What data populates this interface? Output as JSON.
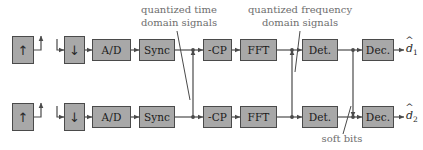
{
  "diagram": {
    "colors": {
      "block_fill": "#a8a8a8",
      "block_border": "#4a4a4a",
      "line": "#4a4a4a",
      "caption_text": "#6e6e6e",
      "background": "#ffffff"
    },
    "antennas": [
      {
        "id": "tx1",
        "symbol": "↑",
        "name": "transmit-antenna-1"
      },
      {
        "id": "rx1",
        "symbol": "↓",
        "name": "receive-antenna-1"
      },
      {
        "id": "tx2",
        "symbol": "↑",
        "name": "transmit-antenna-2"
      },
      {
        "id": "rx2",
        "symbol": "↓",
        "name": "receive-antenna-2"
      }
    ],
    "chains": [
      {
        "id": "chain-1",
        "blocks": [
          {
            "id": "ad-1",
            "label": "A/D"
          },
          {
            "id": "sync-1",
            "label": "Sync"
          },
          {
            "id": "cp-1",
            "label": "-CP"
          },
          {
            "id": "fft-1",
            "label": "FFT"
          },
          {
            "id": "det-1",
            "label": "Det."
          },
          {
            "id": "dec-1",
            "label": "Dec."
          }
        ],
        "output": {
          "base": "d",
          "index": "1"
        }
      },
      {
        "id": "chain-2",
        "blocks": [
          {
            "id": "ad-2",
            "label": "A/D"
          },
          {
            "id": "sync-2",
            "label": "Sync"
          },
          {
            "id": "cp-2",
            "label": "-CP"
          },
          {
            "id": "fft-2",
            "label": "FFT"
          },
          {
            "id": "det-2",
            "label": "Det."
          },
          {
            "id": "dec-2",
            "label": "Dec."
          }
        ],
        "output": {
          "base": "d",
          "index": "2"
        }
      }
    ],
    "captions": {
      "time_domain": {
        "line1": "quantized time",
        "line2": "domain signals"
      },
      "freq_domain": {
        "line1": "quantized frequency",
        "line2": "domain signals"
      },
      "soft_bits": {
        "line1": "soft bits"
      }
    }
  }
}
